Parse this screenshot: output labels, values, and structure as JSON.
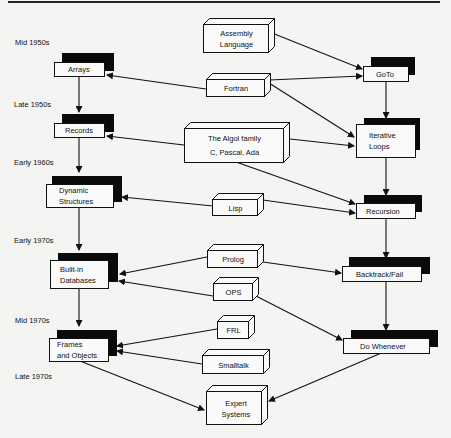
{
  "diagram": {
    "eras": [
      {
        "label": "Mid 1950s"
      },
      {
        "label": "Late 1950s"
      },
      {
        "label": "Early 1960s"
      },
      {
        "label": "Early 1970s"
      },
      {
        "label": "Mid 1970s"
      },
      {
        "label": "Late 1970s"
      }
    ],
    "data_concepts": [
      {
        "lines": [
          "Arrays"
        ]
      },
      {
        "lines": [
          "Records"
        ]
      },
      {
        "lines": [
          "Dynamic",
          "Structures"
        ]
      },
      {
        "lines": [
          "Built-in",
          "Databases"
        ]
      },
      {
        "lines": [
          "Frames",
          "and Objects"
        ]
      }
    ],
    "control_concepts": [
      {
        "lines": [
          "GoTo"
        ]
      },
      {
        "lines": [
          "Iterative",
          "Loops"
        ]
      },
      {
        "lines": [
          "Recursion"
        ]
      },
      {
        "lines": [
          "Backtrack/Fail"
        ]
      },
      {
        "lines": [
          "Do Whenever"
        ]
      }
    ],
    "languages": [
      {
        "lines": [
          "Assembly",
          "Language"
        ]
      },
      {
        "lines": [
          "Fortran"
        ]
      },
      {
        "lines": [
          "The Algol family",
          "C, Pascal, Ada"
        ]
      },
      {
        "lines": [
          "Lisp"
        ]
      },
      {
        "lines": [
          "Prolog"
        ]
      },
      {
        "lines": [
          "OPS"
        ]
      },
      {
        "lines": [
          "FRL"
        ]
      },
      {
        "lines": [
          "Smalltalk"
        ]
      },
      {
        "lines": [
          "Expert",
          "Systems"
        ]
      }
    ],
    "edges": [
      {
        "from": "Arrays",
        "to": "Records"
      },
      {
        "from": "Records",
        "to": "Dynamic Structures"
      },
      {
        "from": "Dynamic Structures",
        "to": "Built-in Databases"
      },
      {
        "from": "Built-in Databases",
        "to": "Frames and Objects"
      },
      {
        "from": "GoTo",
        "to": "Iterative Loops"
      },
      {
        "from": "Iterative Loops",
        "to": "Recursion"
      },
      {
        "from": "Recursion",
        "to": "Backtrack/Fail"
      },
      {
        "from": "Backtrack/Fail",
        "to": "Do Whenever"
      },
      {
        "from": "Assembly Language",
        "to": "GoTo"
      },
      {
        "from": "Fortran",
        "to": "Arrays"
      },
      {
        "from": "Fortran",
        "to": "GoTo"
      },
      {
        "from": "Fortran",
        "to": "Iterative Loops"
      },
      {
        "from": "The Algol family",
        "to": "Records"
      },
      {
        "from": "The Algol family",
        "to": "Iterative Loops"
      },
      {
        "from": "The Algol family",
        "to": "Recursion"
      },
      {
        "from": "Lisp",
        "to": "Dynamic Structures"
      },
      {
        "from": "Lisp",
        "to": "Recursion"
      },
      {
        "from": "Prolog",
        "to": "Built-in Databases"
      },
      {
        "from": "Prolog",
        "to": "Backtrack/Fail"
      },
      {
        "from": "OPS",
        "to": "Built-in Databases"
      },
      {
        "from": "OPS",
        "to": "Do Whenever"
      },
      {
        "from": "FRL",
        "to": "Frames and Objects"
      },
      {
        "from": "Smalltalk",
        "to": "Frames and Objects"
      },
      {
        "from": "Frames and Objects",
        "to": "Expert Systems"
      },
      {
        "from": "Do Whenever",
        "to": "Expert Systems"
      }
    ]
  }
}
